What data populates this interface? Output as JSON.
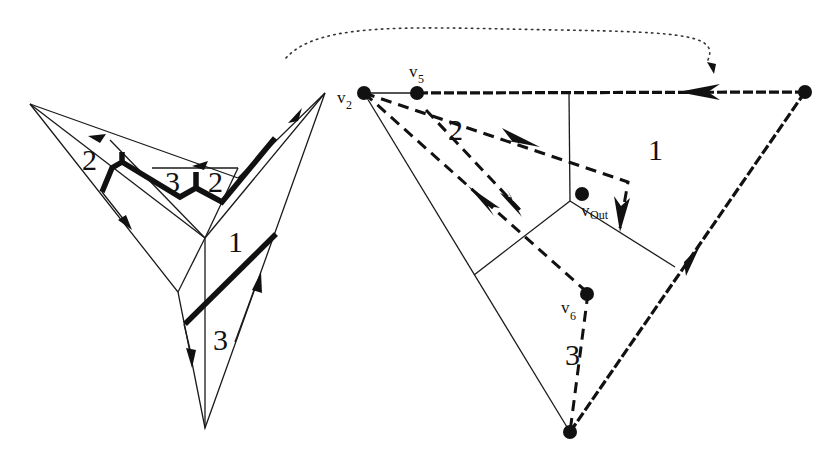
{
  "figure": {
    "left_diagram": {
      "region_labels": [
        {
          "id": "left-2a",
          "text": "2"
        },
        {
          "id": "left-3",
          "text": "3"
        },
        {
          "id": "left-2b",
          "text": "2"
        },
        {
          "id": "left-1",
          "text": "1"
        },
        {
          "id": "left-3b",
          "text": "3"
        }
      ]
    },
    "right_diagram": {
      "vertices": [
        {
          "id": "v2",
          "base": "v",
          "sub": "2"
        },
        {
          "id": "v5",
          "base": "v",
          "sub": "5"
        },
        {
          "id": "vout",
          "base": "v",
          "sub": "Out"
        },
        {
          "id": "v6",
          "base": "v",
          "sub": "6"
        }
      ],
      "region_labels": [
        {
          "id": "right-2",
          "text": "2"
        },
        {
          "id": "right-1",
          "text": "1"
        },
        {
          "id": "right-3",
          "text": "3"
        }
      ]
    },
    "connector": {
      "style": "dotted",
      "direction": "left-to-right"
    },
    "colors": {
      "ink": "#111111",
      "background": "#ffffff"
    }
  }
}
